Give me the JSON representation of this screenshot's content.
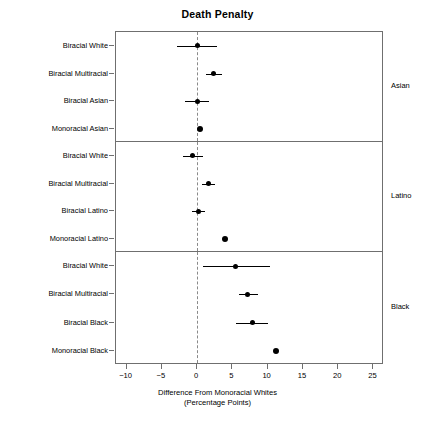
{
  "chart_data": {
    "type": "scatter",
    "title": "Death Penalty",
    "xlabel_line1": "Difference From Monoracial Whites",
    "xlabel_line2": "(Percentage Points)",
    "ylabel": "",
    "xlim": [
      -11.5,
      26.5
    ],
    "xticks": [
      -10,
      -5,
      0,
      5,
      10,
      15,
      20,
      25
    ],
    "xticklabels": [
      "−10",
      "−5",
      "0",
      "5",
      "10",
      "15",
      "20",
      "25"
    ],
    "grid": false,
    "reference_line": 0,
    "reference_line_style": "dashed",
    "legend": "none",
    "panel_label_position": "right",
    "panels": [
      {
        "name": "Asian",
        "rows": [
          {
            "label": "Biracial White",
            "value": 0.0,
            "ci_low": -2.8,
            "ci_high": 2.8,
            "has_ci": true
          },
          {
            "label": "Biracial Multiracial",
            "value": 2.3,
            "ci_low": 1.2,
            "ci_high": 3.6,
            "has_ci": true
          },
          {
            "label": "Biracial Asian",
            "value": 0.0,
            "ci_low": -1.7,
            "ci_high": 1.7,
            "has_ci": true
          },
          {
            "label": "Monoracial Asian",
            "value": 0.4,
            "ci_low": 0.4,
            "ci_high": 0.4,
            "has_ci": false
          }
        ]
      },
      {
        "name": "Latino",
        "rows": [
          {
            "label": "Biracial White",
            "value": -0.7,
            "ci_low": -2.0,
            "ci_high": 0.8,
            "has_ci": true
          },
          {
            "label": "Biracial Multiracial",
            "value": 1.6,
            "ci_low": 0.7,
            "ci_high": 2.5,
            "has_ci": true
          },
          {
            "label": "Biracial Latino",
            "value": 0.2,
            "ci_low": -0.7,
            "ci_high": 1.1,
            "has_ci": true
          },
          {
            "label": "Monoracial Latino",
            "value": 3.9,
            "ci_low": 3.9,
            "ci_high": 3.9,
            "has_ci": false
          }
        ]
      },
      {
        "name": "Black",
        "rows": [
          {
            "label": "Biracial White",
            "value": 5.4,
            "ci_low": 0.8,
            "ci_high": 10.3,
            "has_ci": true
          },
          {
            "label": "Biracial Multiracial",
            "value": 7.1,
            "ci_low": 5.9,
            "ci_high": 8.6,
            "has_ci": true
          },
          {
            "label": "Biracial Black",
            "value": 7.9,
            "ci_low": 5.5,
            "ci_high": 10.0,
            "has_ci": true
          },
          {
            "label": "Monoracial Black",
            "value": 11.2,
            "ci_low": 11.2,
            "ci_high": 11.2,
            "has_ci": false
          }
        ]
      }
    ]
  },
  "colors": {
    "point": "#000000",
    "axis": "#6f6f6f",
    "reference_line": "#8a8a8a",
    "background": "#ffffff"
  }
}
